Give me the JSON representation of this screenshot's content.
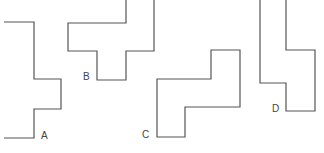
{
  "diagram": {
    "background": "#ffffff",
    "stroke_color": "#555555",
    "label_color": "#444444",
    "shapes": [
      {
        "id": "A",
        "label": "A",
        "points": "4,22 34,22 34,79 61,79 61,109 34,109 34,138 4,138",
        "label_x": 41,
        "label_y": 139
      },
      {
        "id": "B",
        "label": "B",
        "points": "126,0 126,23 68,23 68,51 97,51 97,80 126,80 126,51 154,51 154,0",
        "label_x": 83,
        "label_y": 80
      },
      {
        "id": "C",
        "label": "C",
        "points": "211,50 240,50 240,107 185,107 185,137 157,137 157,79 211,79",
        "label_x": 142,
        "label_y": 138
      },
      {
        "id": "D",
        "label": "D",
        "points": "260,0 260,83 286,83 286,111 315,111 315,50 286,50 286,0",
        "label_x": 272,
        "label_y": 112
      }
    ]
  }
}
